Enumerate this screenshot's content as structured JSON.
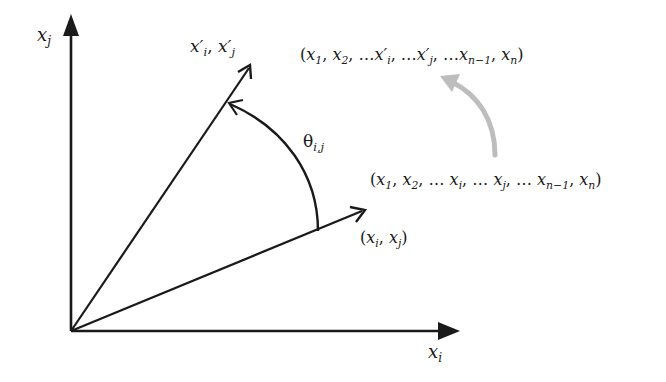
{
  "diagram": {
    "type": "givens-rotation",
    "colors": {
      "stroke": "#1a1a1a",
      "rotation_arrow": "#bdbdbd"
    },
    "axes": {
      "vertical_label": {
        "base": "x",
        "sub": "j"
      },
      "horizontal_label": {
        "base": "x",
        "sub": "i"
      }
    },
    "vectors": {
      "original_label": "(x_i, x_j)",
      "original": {
        "open": "(",
        "a": "x",
        "a_sub": "i",
        "sep": ", ",
        "b": "x",
        "b_sub": "j",
        "close": ")"
      },
      "rotated_label": "x'_i, x'_j",
      "rotated": {
        "a": "x′",
        "a_sub": "i",
        "sep": ", ",
        "b": "x′",
        "b_sub": "j"
      }
    },
    "angle": {
      "symbol": "θ",
      "sub": "i,j"
    },
    "tuples": {
      "original": {
        "text": "(x_1, x_2, … x_i, … x_j, … x_{n−1}, x_n)",
        "parts": [
          {
            "t": "("
          },
          {
            "t": "x",
            "s": "1"
          },
          {
            "t": ", "
          },
          {
            "t": "x",
            "s": "2"
          },
          {
            "t": ", … "
          },
          {
            "t": "x",
            "s": "i"
          },
          {
            "t": ", … "
          },
          {
            "t": "x",
            "s": "j"
          },
          {
            "t": ", … "
          },
          {
            "t": "x",
            "s": "n−1"
          },
          {
            "t": ", "
          },
          {
            "t": "x",
            "s": "n"
          },
          {
            "t": ")"
          }
        ]
      },
      "rotated": {
        "text": "(x_1, x_2, …x'_i, …x'_j, …x_{n−1}, x_n)",
        "parts": [
          {
            "t": "("
          },
          {
            "t": "x",
            "s": "1"
          },
          {
            "t": ", "
          },
          {
            "t": "x",
            "s": "2"
          },
          {
            "t": ", …"
          },
          {
            "t": "x′",
            "s": "i"
          },
          {
            "t": ", …"
          },
          {
            "t": "x′",
            "s": "j"
          },
          {
            "t": ", …"
          },
          {
            "t": "x",
            "s": "n−1"
          },
          {
            "t": ", "
          },
          {
            "t": "x",
            "s": "n"
          },
          {
            "t": ")"
          }
        ]
      }
    }
  }
}
